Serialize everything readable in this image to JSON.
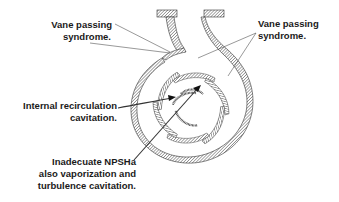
{
  "diagram": {
    "labels": {
      "vane_passing_left": [
        "Vane passing",
        "syndrome."
      ],
      "vane_passing_right": [
        "Vane passing",
        "syndrome."
      ],
      "internal_recirculation": [
        "Internal recirculation",
        "cavitation."
      ],
      "inadequate_npsha": [
        "Inadecuate NPSHa",
        "also vaporization and",
        "turbulence cavitation."
      ]
    },
    "colors": {
      "line": "#222222",
      "hatch": "#555555",
      "text": "#1a1a1a",
      "background": "#ffffff"
    }
  }
}
